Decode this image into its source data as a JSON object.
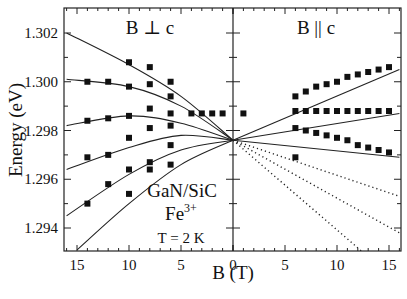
{
  "chart_data": {
    "type": "scatter",
    "title": "",
    "xlabel": "B  (T)",
    "ylabel": "Energy  (eV)",
    "ylim": [
      1.293,
      1.303
    ],
    "xlim": [
      -16,
      16
    ],
    "y_ticks": [
      "1.294",
      "1.296",
      "1.298",
      "1.300",
      "1.302"
    ],
    "y_tick_values": [
      1.294,
      1.296,
      1.298,
      1.3,
      1.302
    ],
    "x_ticks_left": [
      "15",
      "10",
      "5",
      "0"
    ],
    "x_ticks_right": [
      "5",
      "10",
      "15"
    ],
    "panels": [
      {
        "name": "perpendicular",
        "label": "B ⊥ c",
        "x_direction": "reversed"
      },
      {
        "name": "parallel",
        "label": "B || c",
        "x_direction": "normal"
      }
    ],
    "annotations": [
      "GaN/SiC",
      "Fe",
      "3+",
      "T = 2 K"
    ],
    "zero_field_energy": 1.2976,
    "series": [
      {
        "name": "B⊥c level 1 (fit)",
        "panel": "perpendicular",
        "style": "solid",
        "x": [
          0,
          5,
          10,
          16
        ],
        "y": [
          1.2976,
          1.2994,
          1.3007,
          1.302
        ]
      },
      {
        "name": "B⊥c level 2 (fit)",
        "panel": "perpendicular",
        "style": "solid",
        "x": [
          0,
          5,
          10,
          16
        ],
        "y": [
          1.2976,
          1.299,
          1.2998,
          1.3001
        ]
      },
      {
        "name": "B⊥c level 3 (fit)",
        "panel": "perpendicular",
        "style": "solid",
        "x": [
          0,
          5,
          10,
          16
        ],
        "y": [
          1.2976,
          1.2983,
          1.2986,
          1.2982
        ]
      },
      {
        "name": "B⊥c level 4 (fit)",
        "panel": "perpendicular",
        "style": "solid",
        "x": [
          0,
          5,
          10,
          16
        ],
        "y": [
          1.2976,
          1.2978,
          1.2973,
          1.2964
        ]
      },
      {
        "name": "B⊥c level 5 (fit)",
        "panel": "perpendicular",
        "style": "solid",
        "x": [
          0,
          5,
          10,
          16
        ],
        "y": [
          1.2976,
          1.2972,
          1.2962,
          1.2945
        ]
      },
      {
        "name": "B⊥c level 6 (fit)",
        "panel": "perpendicular",
        "style": "solid",
        "x": [
          0,
          5,
          10,
          15
        ],
        "y": [
          1.2976,
          1.2966,
          1.295,
          1.2931
        ]
      },
      {
        "name": "B||c upper (fit)",
        "panel": "parallel",
        "style": "solid",
        "x": [
          0,
          16
        ],
        "y": [
          1.2976,
          1.3005
        ]
      },
      {
        "name": "B||c middle (fit)",
        "panel": "parallel",
        "style": "solid",
        "x": [
          0,
          16
        ],
        "y": [
          1.2976,
          1.2987
        ]
      },
      {
        "name": "B||c lower (fit)",
        "panel": "parallel",
        "style": "solid",
        "x": [
          0,
          16
        ],
        "y": [
          1.2976,
          1.2969
        ]
      },
      {
        "name": "B||c forbidden 1",
        "panel": "parallel",
        "style": "dotted",
        "x": [
          0,
          16
        ],
        "y": [
          1.2976,
          1.2953
        ]
      },
      {
        "name": "B||c forbidden 2",
        "panel": "parallel",
        "style": "dotted",
        "x": [
          0,
          16
        ],
        "y": [
          1.2976,
          1.2938
        ]
      },
      {
        "name": "B||c forbidden 3",
        "panel": "parallel",
        "style": "dotted",
        "x": [
          0,
          12.5
        ],
        "y": [
          1.2976,
          1.293
        ]
      }
    ],
    "points": [
      {
        "panel": "perpendicular",
        "x": 10,
        "y": 1.3008
      },
      {
        "panel": "perpendicular",
        "x": 8,
        "y": 1.3006
      },
      {
        "panel": "perpendicular",
        "x": 6,
        "y": 1.3
      },
      {
        "panel": "perpendicular",
        "x": 14,
        "y": 1.3
      },
      {
        "panel": "perpendicular",
        "x": 12,
        "y": 1.3
      },
      {
        "panel": "perpendicular",
        "x": 10,
        "y": 1.2998
      },
      {
        "panel": "perpendicular",
        "x": 8,
        "y": 1.2999
      },
      {
        "panel": "perpendicular",
        "x": 6,
        "y": 1.2994
      },
      {
        "panel": "perpendicular",
        "x": 14,
        "y": 1.2984
      },
      {
        "panel": "perpendicular",
        "x": 12,
        "y": 1.2985
      },
      {
        "panel": "perpendicular",
        "x": 10,
        "y": 1.2986
      },
      {
        "panel": "perpendicular",
        "x": 8,
        "y": 1.2989
      },
      {
        "panel": "perpendicular",
        "x": 6,
        "y": 1.2987
      },
      {
        "panel": "perpendicular",
        "x": 4,
        "y": 1.2987
      },
      {
        "panel": "perpendicular",
        "x": 3,
        "y": 1.2987
      },
      {
        "panel": "perpendicular",
        "x": 2,
        "y": 1.2987
      },
      {
        "panel": "perpendicular",
        "x": 1,
        "y": 1.2987
      },
      {
        "panel": "perpendicular",
        "x": 14,
        "y": 1.2969
      },
      {
        "panel": "perpendicular",
        "x": 10,
        "y": 1.2977
      },
      {
        "panel": "perpendicular",
        "x": 8,
        "y": 1.2981
      },
      {
        "panel": "perpendicular",
        "x": 6,
        "y": 1.2982
      },
      {
        "panel": "perpendicular",
        "x": 12,
        "y": 1.297
      },
      {
        "panel": "perpendicular",
        "x": 14,
        "y": 1.295
      },
      {
        "panel": "perpendicular",
        "x": 12,
        "y": 1.2958
      },
      {
        "panel": "perpendicular",
        "x": 10,
        "y": 1.2964
      },
      {
        "panel": "perpendicular",
        "x": 8,
        "y": 1.2967
      },
      {
        "panel": "perpendicular",
        "x": 6,
        "y": 1.2974
      },
      {
        "panel": "perpendicular",
        "x": 10,
        "y": 1.2954
      },
      {
        "panel": "perpendicular",
        "x": 8,
        "y": 1.2964
      },
      {
        "panel": "perpendicular",
        "x": 6,
        "y": 1.2966
      },
      {
        "panel": "parallel",
        "x": 1,
        "y": 1.2987
      },
      {
        "panel": "parallel",
        "x": 6,
        "y": 1.2994
      },
      {
        "panel": "parallel",
        "x": 7,
        "y": 1.2996
      },
      {
        "panel": "parallel",
        "x": 8,
        "y": 1.2998
      },
      {
        "panel": "parallel",
        "x": 9,
        "y": 1.2999
      },
      {
        "panel": "parallel",
        "x": 10,
        "y": 1.3
      },
      {
        "panel": "parallel",
        "x": 11,
        "y": 1.3002
      },
      {
        "panel": "parallel",
        "x": 12,
        "y": 1.3003
      },
      {
        "panel": "parallel",
        "x": 13,
        "y": 1.3004
      },
      {
        "panel": "parallel",
        "x": 14,
        "y": 1.3005
      },
      {
        "panel": "parallel",
        "x": 15,
        "y": 1.3006
      },
      {
        "panel": "parallel",
        "x": 6,
        "y": 1.2988
      },
      {
        "panel": "parallel",
        "x": 7,
        "y": 1.2988
      },
      {
        "panel": "parallel",
        "x": 8,
        "y": 1.2988
      },
      {
        "panel": "parallel",
        "x": 9,
        "y": 1.2988
      },
      {
        "panel": "parallel",
        "x": 10,
        "y": 1.2988
      },
      {
        "panel": "parallel",
        "x": 11,
        "y": 1.2988
      },
      {
        "panel": "parallel",
        "x": 12,
        "y": 1.2988
      },
      {
        "panel": "parallel",
        "x": 13,
        "y": 1.2988
      },
      {
        "panel": "parallel",
        "x": 14,
        "y": 1.2988
      },
      {
        "panel": "parallel",
        "x": 15,
        "y": 1.2988
      },
      {
        "panel": "parallel",
        "x": 6,
        "y": 1.2981
      },
      {
        "panel": "parallel",
        "x": 7,
        "y": 1.298
      },
      {
        "panel": "parallel",
        "x": 8,
        "y": 1.2979
      },
      {
        "panel": "parallel",
        "x": 9,
        "y": 1.2978
      },
      {
        "panel": "parallel",
        "x": 10,
        "y": 1.2977
      },
      {
        "panel": "parallel",
        "x": 11,
        "y": 1.2976
      },
      {
        "panel": "parallel",
        "x": 12,
        "y": 1.2974
      },
      {
        "panel": "parallel",
        "x": 13,
        "y": 1.2973
      },
      {
        "panel": "parallel",
        "x": 14,
        "y": 1.2972
      },
      {
        "panel": "parallel",
        "x": 15,
        "y": 1.2971
      },
      {
        "panel": "parallel",
        "x": 6,
        "y": 1.2969
      }
    ],
    "grid": false,
    "legend": "none"
  }
}
